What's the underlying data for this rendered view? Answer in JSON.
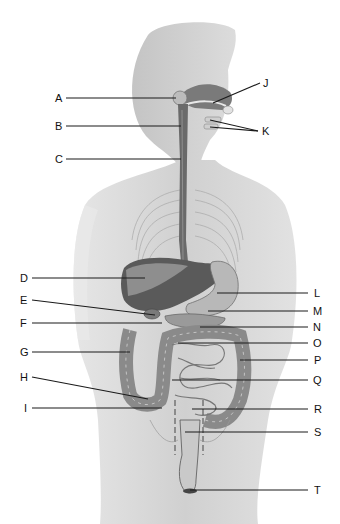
{
  "diagram": {
    "colors": {
      "background": "#ffffff",
      "body_silhouette": "#d6d6d6",
      "body_shadow": "#bdbdbd",
      "organ_dark": "#555555",
      "organ_mid": "#8a8a8a",
      "organ_light": "#b4b4b4",
      "leader_line": "#1a1a1a",
      "label_text": "#111111"
    },
    "labels": {
      "A": "A",
      "B": "B",
      "C": "C",
      "D": "D",
      "E": "E",
      "F": "F",
      "G": "G",
      "H": "H",
      "I": "I",
      "J": "J",
      "K": "K",
      "L": "L",
      "M": "M",
      "N": "N",
      "O": "O",
      "P": "P",
      "Q": "Q",
      "R": "R",
      "S": "S",
      "T": "T"
    }
  }
}
